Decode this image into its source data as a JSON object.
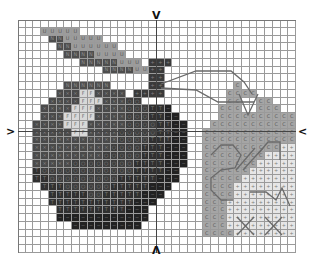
{
  "pattern": {
    "columns": 36,
    "rows": 30,
    "center_markers": [
      "top-arrow",
      "bottom-arrow",
      "left-arrow",
      "right-arrow"
    ],
    "palette": {
      ".": {
        "color": "#ffffff",
        "symbol": ""
      },
      "U": {
        "color": "#9c9c9c",
        "symbol": "U"
      },
      "N": {
        "color": "#4e4e4e",
        "symbol": "N"
      },
      "S": {
        "color": "#3a3a3a",
        "symbol": "+"
      },
      "X": {
        "color": "#4a4a4a",
        "symbol": "×"
      },
      "F": {
        "color": "#d8d8d8",
        "symbol": "F"
      },
      "O": {
        "color": "#3f3f3f",
        "symbol": "○"
      },
      "T": {
        "color": "#303030",
        "symbol": "T"
      },
      "D": {
        "color": "#222222",
        "symbol": "−"
      },
      "C": {
        "color": "#a5a5a5",
        "symbol": "C"
      },
      "P": {
        "color": "#e6e6e6",
        "symbol": "+"
      }
    },
    "grid": [
      "....................................",
      "...UUUUU............................",
      "....NNUUUUU.........................",
      ".....NNUUUUUU.......................",
      "......NNNNUUUU......................",
      "........NNNNNUUU.SSS................",
      "...........NNNNUUSS.................",
      ".................SS.................",
      "......NNNNNN.....SS.........C.......",
      ".....XXXFFXXXX.SSSS........CCCC.....",
      "....XXXXFFFXXXOO...........CC..CC...",
      "...XXXXFFFXXXXOOOTTD......CCC..CCC..",
      "...XXXFFFFXXXXOOOTTDD.....CCCCCCCCCC",
      "..XXXXFFFXXXXXOOOOTTDD...CCCCCCCCCCC",
      "..XXXXXFFXXXXOOOOOTTDD..CCCCCCCCCCCC",
      "..XXXXXXXXXXXOOOOTTTDD..CCCCCCCCCCCC",
      "..XXXXXXXXXXOOOOTTTDDD..CCCCCCCCCCPP",
      "..XXXXXXXXXOOOOOTTTDDD..CCCCCCCCPPPP",
      "..XXXXXOOOOOOOOTTTTDDD..CCCCCCCPPPPP",
      "..TOOOOOOOOOOOOTTTTDD...CCCCCCPPPPPP",
      "..TTOOOOOOOOOTTTTTDDD...CCCCCPPPPPPP",
      "...TTTOOOOOOTTTTTDDD....CCCCPPPPPPPP",
      "....TTTTTOOTTTTTDDD.....CCCCPPPPPPPP",
      "....TTTTTTTTTTTDDD......CCCPPPPPPPPP",
      ".....TTTTTTTTTDDD.......CCCPPPPPPPPP",
      ".....DDDDDDDDDDDD.......CCCPPPPPPPPP",
      ".......DDDDDDDDD........CCCPPPPPPPPP",
      "........................CCCCPPPPPPPP",
      "....................................",
      "...................................."
    ]
  },
  "markers": {
    "top": "V",
    "bottom": "Λ",
    "left": ">",
    "right": "<"
  }
}
